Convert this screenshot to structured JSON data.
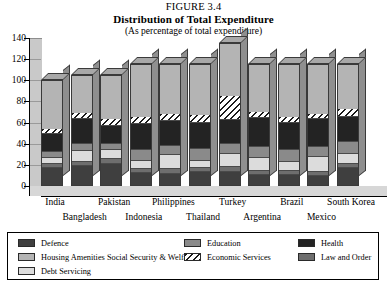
{
  "figure_label": "FIGURE 3.4",
  "title": "Distribution of Total Expenditure",
  "subtitle": "(As percentage of total expenditure)",
  "legend": {
    "items": [
      {
        "label": "Defence",
        "color": "#3f3f3f",
        "pattern": "solid",
        "col": 0,
        "row": 0
      },
      {
        "label": "Housing Amenities Social Security & Welfare",
        "color": "#b4b4b4",
        "pattern": "solid",
        "col": 0,
        "row": 1
      },
      {
        "label": "Debt Servicing",
        "color": "#dcdcdc",
        "pattern": "solid",
        "col": 0,
        "row": 2
      },
      {
        "label": "Education",
        "color": "#8a8a8a",
        "pattern": "solid",
        "col": 1,
        "row": 0
      },
      {
        "label": "Economic Services",
        "color": "#ffffff",
        "pattern": "hatch",
        "col": 1,
        "row": 1
      },
      {
        "label": "Health",
        "color": "#232323",
        "pattern": "solid",
        "col": 2,
        "row": 0
      },
      {
        "label": "Law and Order",
        "color": "#6e6e6e",
        "pattern": "solid",
        "col": 2,
        "row": 1
      }
    ]
  },
  "chart_data": {
    "type": "bar",
    "title": "Distribution of Total Expenditure",
    "subtitle": "(As percentage of total expenditure)",
    "xlabel": "",
    "ylabel": "",
    "ylim": [
      0,
      140
    ],
    "yticks": [
      0,
      20,
      40,
      60,
      80,
      100,
      120,
      140
    ],
    "grid": false,
    "stacked": true,
    "legend_position": "bottom",
    "categories": [
      "India",
      "Bangladesh",
      "Pakistan",
      "Indonesia",
      "Philippines",
      "Thailand",
      "Turkey",
      "Argentina",
      "Brazil",
      "Mexico",
      "South Korea"
    ],
    "series": [
      {
        "name": "Defence",
        "color": "#3f3f3f",
        "pattern": "solid",
        "values": [
          18,
          20,
          22,
          13,
          12,
          14,
          14,
          11,
          11,
          10,
          18
        ]
      },
      {
        "name": "Law and Order",
        "color": "#6e6e6e",
        "pattern": "solid",
        "values": [
          4,
          4,
          4,
          4,
          5,
          4,
          5,
          4,
          4,
          4,
          4
        ]
      },
      {
        "name": "Debt Servicing",
        "color": "#dcdcdc",
        "pattern": "solid",
        "values": [
          5,
          10,
          9,
          8,
          13,
          7,
          12,
          12,
          9,
          14,
          9
        ]
      },
      {
        "name": "Education",
        "color": "#8a8a8a",
        "pattern": "solid",
        "values": [
          6,
          7,
          6,
          10,
          9,
          11,
          10,
          11,
          11,
          10,
          12
        ]
      },
      {
        "name": "Health",
        "color": "#232323",
        "pattern": "solid",
        "values": [
          17,
          23,
          17,
          25,
          23,
          25,
          22,
          27,
          26,
          26,
          23
        ]
      },
      {
        "name": "Economic Services",
        "color": "#ffffff",
        "pattern": "hatch",
        "values": [
          5,
          6,
          6,
          6,
          7,
          7,
          23,
          6,
          5,
          5,
          8
        ]
      },
      {
        "name": "Housing Amenities Social Security & Welfare",
        "color": "#b4b4b4",
        "pattern": "solid",
        "values": [
          45,
          35,
          41,
          49,
          46,
          47,
          49,
          44,
          49,
          46,
          41
        ]
      }
    ],
    "totals": [
      100,
      105,
      105,
      115,
      115,
      115,
      135,
      115,
      115,
      115,
      115
    ]
  }
}
